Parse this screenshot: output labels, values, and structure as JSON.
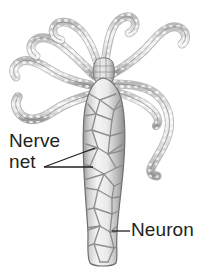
{
  "figure": {
    "background_color": "#ffffff",
    "ink_color": "#231f20",
    "mesh_color": "#8c8c8c",
    "body_fill_color": "#e8e8e8",
    "tentacle_fill_color": "#f2f2f2",
    "shade_color": "#b5b5b5"
  },
  "labels": [
    {
      "name": "nerve-net",
      "line1": "Nerve",
      "line2": "net",
      "x": 9,
      "y": 130,
      "leaders": 2
    },
    {
      "name": "neuron",
      "text": "Neuron",
      "x": 131,
      "y": 219,
      "leaders": 1
    }
  ],
  "anatomy": {
    "tentacle_count": 7,
    "body_parts": [
      "tentacles",
      "hypostome",
      "body column",
      "basal disc"
    ]
  }
}
